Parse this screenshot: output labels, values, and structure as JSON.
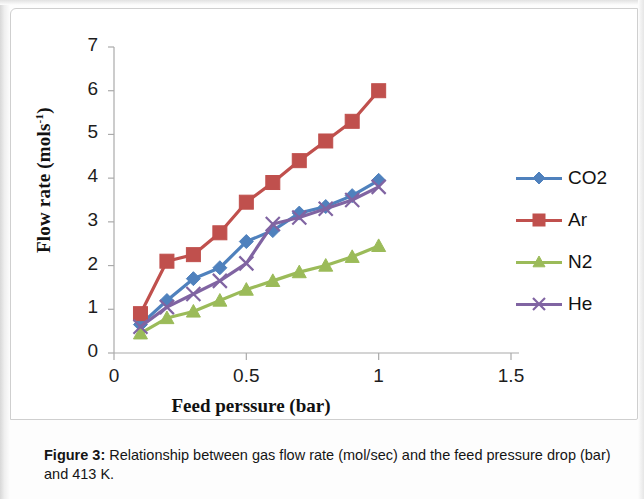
{
  "figure": {
    "caption_label": "Figure 3:",
    "caption_text": " Relationship between gas flow rate (mol/sec) and the feed pressure drop (bar) and 413 K."
  },
  "chart_data": {
    "type": "line",
    "title": "",
    "xlabel": "Feed perssure (bar)",
    "ylabel": "Flow rate (mols-1)",
    "ylabel_base": "Flow rate (mols",
    "ylabel_sup": "-1",
    "ylabel_tail": ")",
    "xlim": [
      0,
      1.5
    ],
    "ylim": [
      0,
      7
    ],
    "xticks": [
      0,
      0.5,
      1,
      1.5
    ],
    "xtick_labels": [
      "0",
      "0.5",
      "1",
      "1.5"
    ],
    "yticks": [
      0,
      1,
      2,
      3,
      4,
      5,
      6,
      7
    ],
    "ytick_labels": [
      "0",
      "1",
      "2",
      "3",
      "4",
      "5",
      "6",
      "7"
    ],
    "grid": false,
    "legend_position": "right",
    "x": [
      0.1,
      0.2,
      0.3,
      0.4,
      0.5,
      0.6,
      0.7,
      0.8,
      0.9,
      1.0
    ],
    "series": [
      {
        "name": "CO2",
        "color": "#4F81BD",
        "marker": "diamond",
        "values": [
          0.65,
          1.2,
          1.7,
          1.95,
          2.55,
          2.8,
          3.2,
          3.35,
          3.6,
          3.95
        ]
      },
      {
        "name": "Ar",
        "color": "#C0504D",
        "marker": "square",
        "values": [
          0.9,
          2.1,
          2.25,
          2.75,
          3.45,
          3.9,
          4.4,
          4.85,
          5.3,
          6.0
        ]
      },
      {
        "name": "N2",
        "color": "#9BBB59",
        "marker": "triangle",
        "values": [
          0.45,
          0.8,
          0.95,
          1.2,
          1.45,
          1.65,
          1.85,
          2.0,
          2.2,
          2.45
        ]
      },
      {
        "name": "He",
        "color": "#8064A2",
        "marker": "cross",
        "values": [
          0.6,
          1.05,
          1.35,
          1.65,
          2.05,
          2.95,
          3.1,
          3.3,
          3.5,
          3.8
        ]
      }
    ]
  }
}
